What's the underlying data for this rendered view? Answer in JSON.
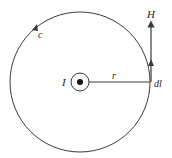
{
  "diagram": {
    "labels": {
      "field": "H",
      "contour": "c",
      "current": "I",
      "radius": "r",
      "element": "dl"
    },
    "colors": {
      "stroke": "#3a3a3a",
      "text": "#222222",
      "background": "#ffffff"
    }
  }
}
